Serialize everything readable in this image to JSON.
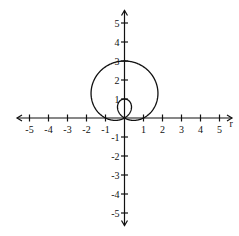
{
  "chart_data": {
    "type": "line",
    "title": "",
    "xlabel": "r",
    "ylabel": "",
    "equation": "r = 1 + 2sin(θ)",
    "xlim": [
      -5.5,
      5.5
    ],
    "ylim": [
      -5.5,
      5.5
    ],
    "grid": false,
    "legend": null,
    "x_ticks": [
      -5,
      -4,
      -3,
      -2,
      -1,
      1,
      2,
      3,
      4,
      5
    ],
    "y_ticks": [
      5,
      4,
      3,
      2,
      1,
      -1,
      -2,
      -3,
      -4,
      -5
    ],
    "x_tick_labels": [
      "-5",
      "-4",
      "-3",
      "-2",
      "-1",
      "1",
      "2",
      "3",
      "4",
      "5"
    ],
    "y_tick_labels": [
      "5",
      "4",
      "3",
      "2",
      "1",
      "-1",
      "-2",
      "-3",
      "-4",
      "-5"
    ],
    "series": [
      {
        "name": "outer loop",
        "key_points": [
          {
            "x": 0,
            "y": 3
          },
          {
            "x": -1.73,
            "y": 1.5
          },
          {
            "x": 1.73,
            "y": 1.5
          },
          {
            "x": -1,
            "y": 0
          },
          {
            "x": 1,
            "y": 0
          },
          {
            "x": 0,
            "y": 0
          }
        ]
      },
      {
        "name": "inner loop",
        "key_points": [
          {
            "x": 0,
            "y": 1
          },
          {
            "x": -0.29,
            "y": 0.5
          },
          {
            "x": 0.29,
            "y": 0.5
          },
          {
            "x": 0,
            "y": 0
          }
        ]
      }
    ],
    "axis_label_x": "r"
  }
}
